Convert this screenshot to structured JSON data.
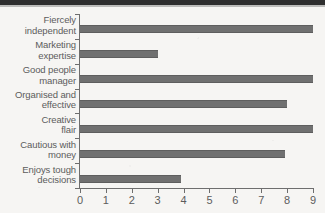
{
  "chart_data": {
    "type": "bar",
    "orientation": "horizontal",
    "title": "",
    "xlabel": "",
    "ylabel": "",
    "categories": [
      "Fiercely\nindependent",
      "Marketing\nexpertise",
      "Good people\nmanager",
      "Organised and\neffective",
      "Creative\nflair",
      "Cautious with\nmoney",
      "Enjoys tough\ndecisions"
    ],
    "values": [
      9,
      3,
      9,
      8,
      9,
      7.9,
      3.9
    ],
    "xlim": [
      0,
      9
    ],
    "xticks": [
      0,
      1,
      2,
      3,
      4,
      5,
      6,
      7,
      8,
      9
    ],
    "xticklabels": [
      "0",
      "1",
      "2",
      "3",
      "4",
      "5",
      "6",
      "7",
      "8",
      "9"
    ],
    "grid": false,
    "legend": false,
    "bar_color": "#707070",
    "axis_color": "#6e6e6e",
    "background_color": "#f6f5f3",
    "text_color": "#5c5c5c"
  }
}
